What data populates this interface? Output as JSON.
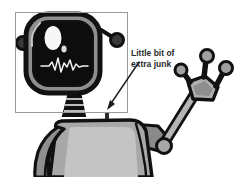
{
  "illustration": {
    "title": "Cartoon robot with screen head",
    "subject": "robot",
    "style": "grayscale cartoon line art",
    "background_color": "#ffffff"
  },
  "annotation": {
    "label_line1": "Little bit of",
    "label_line2": "extra junk",
    "label_full": "Little bit of extra junk",
    "text_color": "#2b2b2b",
    "arrow": {
      "color": "#1a1a1a",
      "from_x": 139,
      "from_y": 62,
      "to_x": 107,
      "to_y": 108
    },
    "target": {
      "name": "extra-junk-artifact",
      "x": 107,
      "y": 112,
      "width": 4,
      "height": 6,
      "color": "#2a2a2a"
    }
  },
  "crop_box": {
    "x": 15,
    "y": 12,
    "width": 113,
    "height": 101,
    "border_color": "#9a9a9a",
    "border_width": 1
  },
  "palette": {
    "outline": "#111111",
    "screen_dark": "#0d0d0d",
    "bezel_gray": "#8f8f8f",
    "body_gray": "#a8a8a8",
    "body_light": "#c2c2c2",
    "body_dark": "#6f6f6f",
    "highlight_white": "#f7f7f7",
    "waveform": "#f2f2f2"
  },
  "robot_parts": [
    {
      "name": "head-screen",
      "label": "Screen head"
    },
    {
      "name": "eye",
      "label": "Eye"
    },
    {
      "name": "eye-glint",
      "label": "Eye glint"
    },
    {
      "name": "waveform",
      "label": "Heartbeat waveform"
    },
    {
      "name": "left-antenna",
      "label": "Left antenna"
    },
    {
      "name": "right-antenna",
      "label": "Right antenna"
    },
    {
      "name": "neck",
      "label": "Ribbed neck"
    },
    {
      "name": "torso",
      "label": "Torso"
    },
    {
      "name": "left-shoulder",
      "label": "Left shoulder"
    },
    {
      "name": "right-shoulder",
      "label": "Right shoulder"
    },
    {
      "name": "arm",
      "label": "Raised arm"
    },
    {
      "name": "hand",
      "label": "Three-finger hand"
    }
  ]
}
